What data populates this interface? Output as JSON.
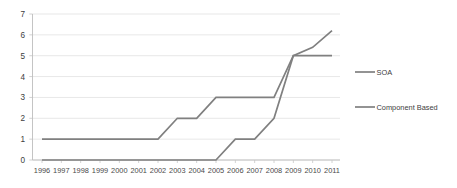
{
  "chart_data": {
    "type": "line",
    "title": "",
    "xlabel": "",
    "ylabel": "",
    "categories": [
      "1996",
      "1997",
      "1998",
      "1999",
      "2000",
      "2001",
      "2002",
      "2003",
      "2004",
      "2005",
      "2006",
      "2007",
      "2008",
      "2009",
      "2010",
      "2011"
    ],
    "xtick_labels": [
      "1996",
      "1997",
      "1998",
      "1999",
      "2000",
      "2001",
      "2002",
      "2003",
      "2004",
      "2005",
      "2006",
      "2007",
      "2008",
      "2009",
      "2010",
      "2011"
    ],
    "ytick_labels": [
      "0",
      "1",
      "2",
      "3",
      "4",
      "5",
      "6",
      "7"
    ],
    "ylim": [
      0,
      7
    ],
    "grid": true,
    "legend_position": "right",
    "series": [
      {
        "name": "SOA",
        "color": "#808080",
        "values": [
          1,
          1,
          1,
          1,
          1,
          1,
          1,
          2,
          2,
          3,
          3,
          3,
          3,
          5,
          5.4,
          6.2
        ]
      },
      {
        "name": "Component Based",
        "color": "#808080",
        "values": [
          0,
          0,
          0,
          0,
          0,
          0,
          0,
          0,
          0,
          0,
          1,
          1,
          2,
          5,
          5,
          5
        ]
      }
    ],
    "legend": [
      {
        "label": "SOA",
        "color": "#808080"
      },
      {
        "label": "Component Based",
        "color": "#808080"
      }
    ]
  }
}
